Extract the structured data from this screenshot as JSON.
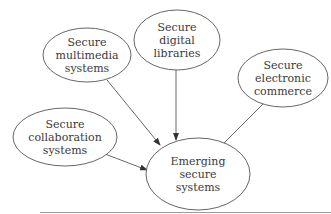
{
  "diagram": {
    "type": "flow",
    "nodes": [
      {
        "id": "multimedia",
        "lines": [
          "Secure",
          "multimedia",
          "systems"
        ]
      },
      {
        "id": "libraries",
        "lines": [
          "Secure",
          "digital",
          "libraries"
        ]
      },
      {
        "id": "commerce",
        "lines": [
          "Secure",
          "electronic",
          "commerce"
        ]
      },
      {
        "id": "collaboration",
        "lines": [
          "Secure",
          "collaboration",
          "systems"
        ]
      },
      {
        "id": "emerging",
        "lines": [
          "Emerging",
          "secure",
          "systems"
        ]
      }
    ],
    "edges": [
      {
        "from": "multimedia",
        "to": "emerging"
      },
      {
        "from": "libraries",
        "to": "emerging"
      },
      {
        "from": "commerce",
        "to": "emerging"
      },
      {
        "from": "collaboration",
        "to": "emerging"
      }
    ],
    "colors": {
      "stroke": "#555555",
      "text": "#3a3a3a",
      "rule": "#9a9a9a"
    }
  }
}
